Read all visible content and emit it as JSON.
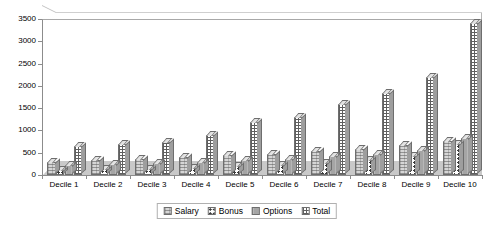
{
  "chart_data": {
    "type": "bar",
    "title": "",
    "subtitle": "",
    "xlabel": "",
    "ylabel": "",
    "ylim": [
      0,
      3500
    ],
    "ytick_step": 500,
    "yticks": [
      0,
      500,
      1000,
      1500,
      2000,
      2500,
      3000,
      3500
    ],
    "ytick_labels": [
      "0",
      "500",
      "1000",
      "1500",
      "2000",
      "2500",
      "3000",
      "3500"
    ],
    "grid": true,
    "grid_axis": "y",
    "legend_position": "bottom-center",
    "three_d": true,
    "categories": [
      "Decile 1",
      "Decile 2",
      "Decile 3",
      "Decile 4",
      "Decile 5",
      "Decile 6",
      "Decile 7",
      "Decile 8",
      "Decile 9",
      "Decile 10"
    ],
    "series": [
      {
        "name": "Salary",
        "color": "#d6d6d6",
        "pattern": "cross-hatch-light",
        "values": [
          290,
          330,
          360,
          400,
          440,
          480,
          530,
          590,
          680,
          760
        ]
      },
      {
        "name": "Bonus",
        "color": "#ffffff",
        "pattern": "dotted",
        "values": [
          110,
          130,
          140,
          160,
          200,
          230,
          280,
          330,
          420,
          700
        ]
      },
      {
        "name": "Options",
        "color": "#a5a5a5",
        "pattern": "solid-gray",
        "values": [
          230,
          250,
          260,
          300,
          330,
          360,
          420,
          470,
          560,
          830
        ]
      },
      {
        "name": "Total",
        "color": "#ffffff",
        "pattern": "dense-grid",
        "values": [
          650,
          700,
          750,
          900,
          1200,
          1300,
          1600,
          1850,
          2200,
          3400
        ]
      }
    ]
  },
  "legend": {
    "items": [
      {
        "label": "Salary"
      },
      {
        "label": "Bonus"
      },
      {
        "label": "Options"
      },
      {
        "label": "Total"
      }
    ]
  }
}
